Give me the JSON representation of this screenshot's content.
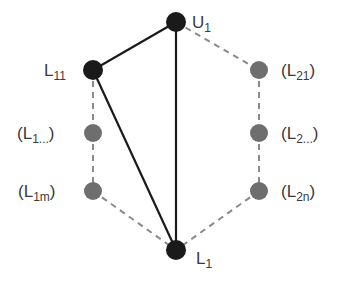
{
  "colors": {
    "background": "#ffffff",
    "active_node": "#1a1a1a",
    "inactive_node": "#6e6e6e",
    "solid_edge": "#1a1a1a",
    "dashed_edge": "#8a8a8a",
    "label": "#3a3a3a"
  },
  "nodes": {
    "u1": {
      "main": "U",
      "sub": "1",
      "pre": "",
      "post": "",
      "x": 176,
      "y": 22,
      "state": "active"
    },
    "l11": {
      "main": "L",
      "sub": "11",
      "pre": "",
      "post": "",
      "x": 93,
      "y": 70,
      "state": "active"
    },
    "l1dots": {
      "main": "L",
      "sub": "1...",
      "pre": "(",
      "post": ")",
      "x": 93,
      "y": 133,
      "state": "inactive"
    },
    "l1m": {
      "main": "L",
      "sub": "1m",
      "pre": "(",
      "post": ")",
      "x": 93,
      "y": 191,
      "state": "inactive"
    },
    "l1": {
      "main": "L",
      "sub": "1",
      "pre": "",
      "post": "",
      "x": 176,
      "y": 250,
      "state": "active"
    },
    "l21": {
      "main": "L",
      "sub": "21",
      "pre": "(",
      "post": ")",
      "x": 259,
      "y": 70,
      "state": "inactive"
    },
    "l2dots": {
      "main": "L",
      "sub": "2...",
      "pre": "(",
      "post": ")",
      "x": 259,
      "y": 133,
      "state": "inactive"
    },
    "l2n": {
      "main": "L",
      "sub": "2n",
      "pre": "(",
      "post": ")",
      "x": 259,
      "y": 191,
      "state": "inactive"
    }
  },
  "edges": [
    {
      "from": "u1",
      "to": "l11",
      "style": "solid"
    },
    {
      "from": "l11",
      "to": "l1",
      "style": "solid"
    },
    {
      "from": "u1",
      "to": "l1",
      "style": "solid"
    },
    {
      "from": "u1",
      "to": "l21",
      "style": "dashed"
    },
    {
      "from": "l21",
      "to": "l2dots",
      "style": "dashed"
    },
    {
      "from": "l2dots",
      "to": "l2n",
      "style": "dashed"
    },
    {
      "from": "l2n",
      "to": "l1",
      "style": "dashed"
    },
    {
      "from": "l11",
      "to": "l1dots",
      "style": "dashed"
    },
    {
      "from": "l1dots",
      "to": "l1m",
      "style": "dashed"
    },
    {
      "from": "l1m",
      "to": "l1",
      "style": "dashed"
    }
  ]
}
